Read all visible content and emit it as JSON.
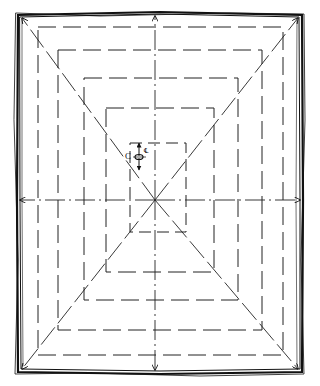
{
  "diagram": {
    "type": "hand-drawn plan sketch",
    "colors": {
      "ink": "#111111",
      "paper": "#ffffff"
    },
    "outer_border": {
      "x": 18,
      "y": 14,
      "width": 284,
      "height": 358
    },
    "center": {
      "x": 155,
      "y": 200
    },
    "contour_rings": [
      {
        "x": 38,
        "y": 27,
        "width": 245,
        "height": 328
      },
      {
        "x": 58,
        "y": 50,
        "width": 204,
        "height": 280
      },
      {
        "x": 84,
        "y": 78,
        "width": 154,
        "height": 222
      },
      {
        "x": 106,
        "y": 108,
        "width": 108,
        "height": 164
      },
      {
        "x": 130,
        "y": 143,
        "width": 56,
        "height": 89
      }
    ],
    "axes": {
      "vertical": {
        "arrows": [
          "up",
          "down"
        ]
      },
      "horizontal": {
        "arrows": [
          "left",
          "right"
        ]
      }
    },
    "diagonals": {
      "count": 4,
      "arrowheads": "at outer corners"
    },
    "annotation": {
      "text": "C",
      "symbol": "centerline-symbol",
      "symbol_glyph": "℄",
      "dimension_arrows": "vertical double-headed"
    }
  }
}
